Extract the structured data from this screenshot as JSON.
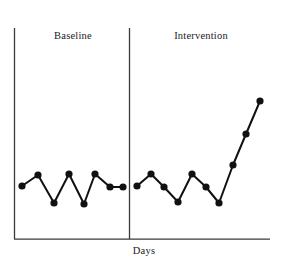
{
  "figure": {
    "width": 285,
    "height": 261,
    "background": "#ffffff",
    "ink_color": "#111111",
    "axis_color": "#3a3a3a"
  },
  "labels": {
    "phase_a": "Baseline",
    "phase_b": "Intervention",
    "xlabel": "Days",
    "ylabel": ""
  },
  "chart_data": {
    "type": "line",
    "title": "",
    "subtitle": "",
    "xlabel": "Days",
    "ylabel": "",
    "grid": false,
    "legend": null,
    "legend_position": "none",
    "marker": "filled-circle",
    "annotations": [
      {
        "text": "Baseline",
        "role": "phase-label",
        "phase": "A"
      },
      {
        "text": "Intervention",
        "role": "phase-label",
        "phase": "B"
      }
    ],
    "phase_change_line": {
      "x": 8.5,
      "style": "solid-vertical",
      "label": ""
    },
    "axis": {
      "xlim": [
        0,
        17.8
      ],
      "ylim": [
        0,
        10
      ],
      "x_ticks": [],
      "y_ticks": [],
      "x_tick_labels": [],
      "y_tick_labels": [],
      "spines": [
        "left",
        "bottom"
      ]
    },
    "x": [
      1,
      2,
      3,
      4,
      5,
      6,
      7,
      8,
      9,
      10,
      11,
      12,
      13,
      14,
      15,
      16,
      17,
      18
    ],
    "series": [
      {
        "name": "Baseline",
        "phase": "A",
        "x": [
          1,
          2,
          3,
          4,
          5,
          6,
          7,
          8
        ],
        "values": [
          2.6,
          3.1,
          1.8,
          3.2,
          1.7,
          3.2,
          2.5,
          2.5
        ]
      },
      {
        "name": "Intervention",
        "phase": "B",
        "x": [
          9,
          10,
          11,
          12,
          13,
          14,
          15,
          16,
          17,
          18
        ],
        "values": [
          2.6,
          3.2,
          2.5,
          1.8,
          3.2,
          2.5,
          1.8,
          3.6,
          5.1,
          6.6
        ]
      }
    ],
    "pixel_geometry": {
      "note": "device pixel coordinates of plotted markers in the 285x261 image",
      "y_axis_x": 14,
      "x_axis_y": 239,
      "plot_top_y": 28,
      "x_axis_right": 270,
      "phase_line_x": 129,
      "marker_radius": 3.6,
      "line_width": 2.0,
      "baseline_points": [
        [
          22,
          186
        ],
        [
          38,
          175
        ],
        [
          54,
          203
        ],
        [
          69,
          174
        ],
        [
          84,
          204
        ],
        [
          95,
          174
        ],
        [
          110,
          187
        ],
        [
          123,
          187
        ]
      ],
      "intervention_points": [
        [
          137,
          186
        ],
        [
          151,
          174
        ],
        [
          164,
          187
        ],
        [
          178,
          202
        ],
        [
          192,
          174
        ],
        [
          206,
          187
        ],
        [
          219,
          203
        ],
        [
          233,
          165
        ],
        [
          246,
          134
        ],
        [
          260,
          101
        ]
      ]
    }
  }
}
